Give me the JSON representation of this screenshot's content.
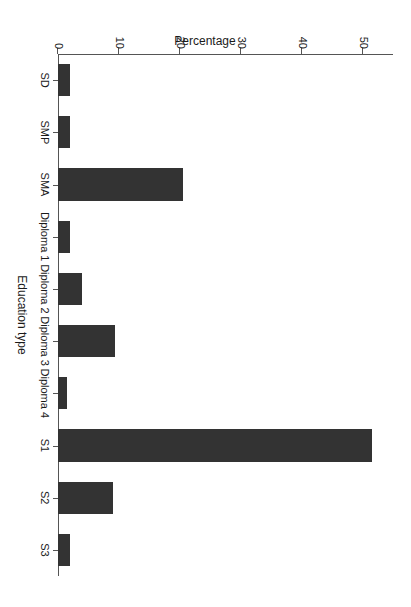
{
  "chart_data": {
    "type": "bar",
    "title": "",
    "subtitle": "",
    "xlabel": "Education type",
    "ylabel": "Percentage",
    "categories": [
      "SD",
      "SMP",
      "SMA",
      "Diploma 1",
      "Diploma 2",
      "Diploma 3",
      "Diploma 4",
      "S1",
      "S2",
      "S3"
    ],
    "values": [
      1.9,
      1.9,
      20.5,
      1.9,
      4.0,
      9.4,
      1.4,
      51.6,
      9.1,
      1.9
    ],
    "ylim": [
      0,
      55
    ],
    "yticks": [
      0,
      10,
      20,
      30,
      40,
      50
    ],
    "yticklabels": [
      "0",
      "10",
      "20",
      "30",
      "40",
      "50"
    ],
    "xlim_categories": 10,
    "grid": false,
    "legend": null,
    "orientation": "vertical-bars-rotated-90-cw",
    "bar_color": "#333333",
    "axis_color": "#555555",
    "background_color": "#ffffff",
    "annotations": []
  },
  "figure": {
    "rotation_degrees": 90,
    "width_px": 411,
    "height_px": 607
  }
}
